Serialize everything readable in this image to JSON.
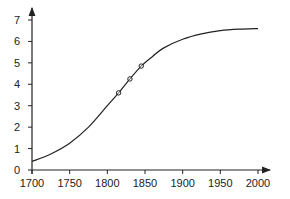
{
  "chart_data": {
    "type": "line",
    "title": "",
    "xlabel": "",
    "ylabel": "",
    "xlim": [
      1700,
      2000
    ],
    "ylim": [
      0,
      7
    ],
    "grid": false,
    "legend": null,
    "x_ticks": [
      1700,
      1750,
      1800,
      1850,
      1900,
      1950,
      2000
    ],
    "y_ticks": [
      0,
      1,
      2,
      3,
      4,
      5,
      6,
      7
    ],
    "series": [
      {
        "name": "logistic curve",
        "style": "line",
        "x": [
          1700,
          1725,
          1750,
          1775,
          1800,
          1815,
          1830,
          1845,
          1860,
          1875,
          1900,
          1925,
          1950,
          1975,
          2000
        ],
        "values": [
          0.4,
          0.75,
          1.25,
          2.0,
          3.0,
          3.6,
          4.25,
          4.85,
          5.3,
          5.7,
          6.1,
          6.35,
          6.5,
          6.57,
          6.6
        ]
      },
      {
        "name": "observed points",
        "style": "markers",
        "marker": "circle-slash",
        "x": [
          1815,
          1830,
          1845
        ],
        "values": [
          3.6,
          4.25,
          4.85
        ]
      }
    ]
  }
}
